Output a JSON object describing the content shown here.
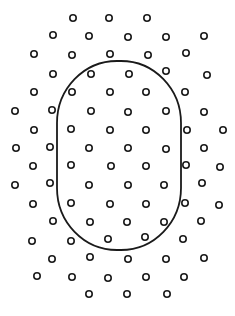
{
  "diagram": {
    "width": 235,
    "height": 316,
    "background": "#ffffff",
    "stroke_color": "#1a1a1a",
    "dot_radius": 3.2,
    "dot_stroke_width": 1.6,
    "boundary": {
      "shape": "rounded-rectangle",
      "x": 57,
      "y": 61,
      "width": 124,
      "height": 189,
      "rx": 60,
      "ry": 62,
      "stroke_width": 1.8
    },
    "dots": [
      [
        73,
        18
      ],
      [
        109,
        18
      ],
      [
        147,
        18
      ],
      [
        53,
        35
      ],
      [
        89,
        36
      ],
      [
        128,
        37
      ],
      [
        166,
        37
      ],
      [
        204,
        36
      ],
      [
        34,
        54
      ],
      [
        72,
        55
      ],
      [
        110,
        54
      ],
      [
        148,
        55
      ],
      [
        186,
        53
      ],
      [
        53,
        74
      ],
      [
        91,
        74
      ],
      [
        129,
        74
      ],
      [
        166,
        71
      ],
      [
        207,
        75
      ],
      [
        34,
        92
      ],
      [
        72,
        92
      ],
      [
        110,
        92
      ],
      [
        146,
        92
      ],
      [
        185,
        92
      ],
      [
        15,
        111
      ],
      [
        52,
        110
      ],
      [
        91,
        111
      ],
      [
        128,
        112
      ],
      [
        166,
        111
      ],
      [
        204,
        112
      ],
      [
        34,
        130
      ],
      [
        71,
        129
      ],
      [
        110,
        130
      ],
      [
        146,
        130
      ],
      [
        187,
        130
      ],
      [
        223,
        130
      ],
      [
        16,
        148
      ],
      [
        50,
        147
      ],
      [
        89,
        148
      ],
      [
        128,
        148
      ],
      [
        166,
        149
      ],
      [
        204,
        148
      ],
      [
        33,
        166
      ],
      [
        71,
        165
      ],
      [
        111,
        166
      ],
      [
        146,
        166
      ],
      [
        186,
        165
      ],
      [
        220,
        167
      ],
      [
        15,
        185
      ],
      [
        50,
        183
      ],
      [
        89,
        185
      ],
      [
        128,
        185
      ],
      [
        164,
        185
      ],
      [
        202,
        183
      ],
      [
        33,
        204
      ],
      [
        71,
        203
      ],
      [
        110,
        204
      ],
      [
        146,
        204
      ],
      [
        185,
        203
      ],
      [
        219,
        205
      ],
      [
        53,
        221
      ],
      [
        90,
        222
      ],
      [
        127,
        222
      ],
      [
        164,
        222
      ],
      [
        201,
        221
      ],
      [
        32,
        241
      ],
      [
        71,
        241
      ],
      [
        108,
        239
      ],
      [
        145,
        237
      ],
      [
        183,
        239
      ],
      [
        52,
        259
      ],
      [
        90,
        257
      ],
      [
        128,
        259
      ],
      [
        166,
        259
      ],
      [
        204,
        258
      ],
      [
        37,
        276
      ],
      [
        72,
        277
      ],
      [
        108,
        278
      ],
      [
        146,
        277
      ],
      [
        184,
        277
      ],
      [
        89,
        294
      ],
      [
        127,
        294
      ],
      [
        167,
        294
      ]
    ]
  }
}
